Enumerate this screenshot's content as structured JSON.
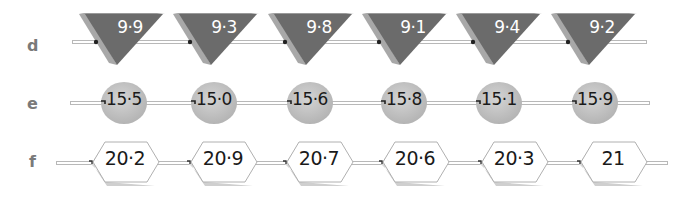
{
  "rows": [
    {
      "label": "d",
      "shape": "inverted-triangle",
      "values": [
        "9·9",
        "9·3",
        "9·8",
        "9·1",
        "9·4",
        "9·2"
      ]
    },
    {
      "label": "e",
      "shape": "circle",
      "values": [
        "15·5",
        "15·0",
        "15·6",
        "15·8",
        "15·1",
        "15·9"
      ]
    },
    {
      "label": "f",
      "shape": "hexagon",
      "values": [
        "20·2",
        "20·9",
        "20·7",
        "20·6",
        "20·3",
        "21"
      ]
    }
  ],
  "colors": {
    "triangle_fill": "#6b6b6b",
    "triangle_side": "#a8a8a8",
    "circle_fill": "#c4c4c4",
    "hexagon_fill": "#ffffff",
    "hexagon_stroke": "#b0b0b0",
    "label_color": "#7a7a7a",
    "track_stroke": "#b8b8b8"
  }
}
